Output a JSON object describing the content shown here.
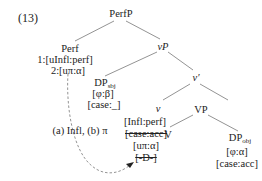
{
  "example_number": "(13)",
  "nodes": {
    "perfP": "PerfP",
    "perf": "Perf",
    "perf_feature_1": "1:[uInfl:perf]",
    "perf_feature_2": "2:[uπ:α]",
    "vP": "vP",
    "dp_subj": {
      "label": "DP",
      "subscript": "sbj",
      "features": [
        "[φ:β]",
        "[case:_]"
      ]
    },
    "v_bar": "v′",
    "v": {
      "label": "v",
      "features": [
        "[Infl:perf]",
        "[case:acc]",
        "[uπ:α]",
        "[-D-]"
      ],
      "struck": [
        false,
        true,
        false,
        true
      ]
    },
    "VP": "VP",
    "V": "V",
    "dp_obj": {
      "label": "DP",
      "subscript": "obj",
      "features": [
        "[φ:α]",
        "[case:acc]"
      ]
    }
  },
  "annotation": "(a) Infl, (b) π",
  "colors": {
    "line": "#777777",
    "text": "#222222"
  }
}
